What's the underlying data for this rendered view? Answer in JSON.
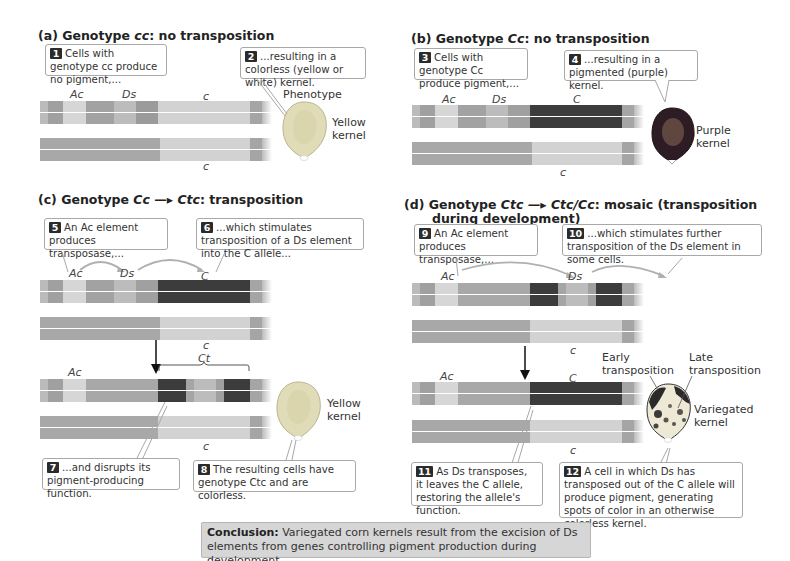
{
  "panels": {
    "a": {
      "title_prefix": "(a)  Genotype ",
      "title_geno": "cc",
      "title_suffix": ": no transposition",
      "callouts": [
        {
          "num": "1",
          "text": "Cells with genotype cc produce no pigment,..."
        },
        {
          "num": "2",
          "text": "...resulting in a colorless (yellow or white) kernel."
        }
      ],
      "labels": {
        "ac": "Ac",
        "ds": "Ds",
        "c_top": "c",
        "c_bottom": "c"
      },
      "phenotype_label": "Phenotype",
      "kernel_label": "Yellow kernel"
    },
    "b": {
      "title_prefix": "(b)  Genotype ",
      "title_geno": "Cc",
      "title_suffix": ": no transposition",
      "callouts": [
        {
          "num": "3",
          "text": "Cells with genotype Cc produce pigment,..."
        },
        {
          "num": "4",
          "text": "...resulting in a pigmented (purple) kernel."
        }
      ],
      "labels": {
        "ac": "Ac",
        "ds": "Ds",
        "c_top": "C",
        "c_bottom": "c"
      },
      "kernel_label": "Purple kernel"
    },
    "c": {
      "title_prefix": "(c)  Genotype ",
      "title_geno": "Cc",
      "title_arrow": "—▸",
      "title_geno2": "Ctc",
      "title_suffix": ": transposition",
      "callouts": [
        {
          "num": "5",
          "text": "An Ac element produces transposase,..."
        },
        {
          "num": "6",
          "text": "...which stimulates transposition of a Ds element into the C allele..."
        },
        {
          "num": "7",
          "text": "...and disrupts its pigment-producing function."
        },
        {
          "num": "8",
          "text": "The resulting cells have genotype Ctc and are colorless."
        }
      ],
      "labels": {
        "ac": "Ac",
        "ds": "Ds",
        "c_top": "C",
        "c_mid": "c",
        "ct": "Ct",
        "ac2": "Ac",
        "c_bottom": "c"
      },
      "kernel_label": "Yellow kernel"
    },
    "d": {
      "title_prefix": "(d)  Genotype ",
      "title_geno": "Ctc",
      "title_arrow": "—▸",
      "title_geno2": "Ctc/Cc",
      "title_suffix": ":  mosaic (transposition",
      "title_line2": "during development)",
      "callouts": [
        {
          "num": "9",
          "text": "An Ac element produces transposase,..."
        },
        {
          "num": "10",
          "text": "...which stimulates further transposition of the Ds element in some cells."
        },
        {
          "num": "11",
          "text": "As Ds transposes, it leaves the C allele, restoring the allele's function."
        },
        {
          "num": "12",
          "text": "A cell in which Ds has transposed out of the C allele will produce pigment, generating spots of color in an otherwise colorless kernel."
        }
      ],
      "labels": {
        "ac": "Ac",
        "ds": "Ds",
        "c_mid": "c",
        "ac2": "Ac",
        "c_top2": "C",
        "c_bottom": "c"
      },
      "early_label": "Early transposition",
      "late_label": "Late transposition",
      "kernel_label": "Variegated kernel"
    }
  },
  "conclusion": {
    "lead": "Conclusion:",
    "text": " Variegated corn kernels result from the excision of Ds elements from genes controlling pigment production during development."
  },
  "colors": {
    "light": "#d7d7d7",
    "mid": "#a9a9a9",
    "midlight": "#bdbdbd",
    "dark": "#3a3a3a",
    "end": "#9a9a9a",
    "yellow_kernel": "#e2d9a8",
    "purple_kernel": "#3a2430"
  }
}
